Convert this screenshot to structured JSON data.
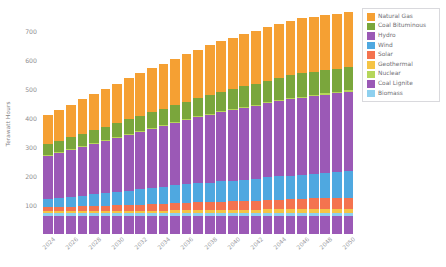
{
  "chart_data": {
    "type": "bar",
    "stacked": true,
    "title": "",
    "xlabel": "",
    "ylabel": "Terawatt Hours",
    "ylim": [
      0,
      760
    ],
    "yticks": [
      100,
      200,
      300,
      400,
      500,
      600,
      700
    ],
    "grid": false,
    "legend_position": "right",
    "x": [
      2024,
      2025,
      2026,
      2027,
      2028,
      2029,
      2030,
      2031,
      2032,
      2033,
      2034,
      2035,
      2036,
      2037,
      2038,
      2039,
      2040,
      2041,
      2042,
      2043,
      2044,
      2045,
      2046,
      2047,
      2048,
      2049,
      2050
    ],
    "xtick_labels": [
      "2024",
      "2026",
      "2028",
      "2030",
      "2032",
      "2034",
      "2036",
      "2038",
      "2040",
      "2042",
      "2044",
      "2046",
      "2048",
      "2050"
    ],
    "series": [
      {
        "name": "Coal Lignite",
        "color": "#9b59b6",
        "values": [
          62,
          62,
          62,
          62,
          62,
          62,
          62,
          62,
          62,
          62,
          62,
          62,
          62,
          62,
          62,
          62,
          62,
          62,
          62,
          62,
          62,
          62,
          62,
          62,
          62,
          62,
          62
        ]
      },
      {
        "name": "Biomass",
        "color": "#8ed0ef",
        "values": [
          10,
          10,
          10,
          10,
          10,
          10,
          10,
          10,
          10,
          11,
          11,
          11,
          11,
          11,
          11,
          11,
          11,
          11,
          11,
          12,
          12,
          12,
          12,
          12,
          12,
          12,
          12
        ]
      },
      {
        "name": "Geothermal",
        "color": "#f5c445",
        "values": [
          6,
          6,
          6,
          7,
          7,
          7,
          7,
          8,
          8,
          8,
          8,
          9,
          9,
          9,
          9,
          10,
          10,
          10,
          10,
          11,
          11,
          11,
          11,
          12,
          12,
          12,
          12
        ]
      },
      {
        "name": "Solar",
        "color": "#f4734f",
        "values": [
          14,
          15,
          16,
          17,
          18,
          19,
          20,
          21,
          22,
          23,
          24,
          25,
          26,
          27,
          28,
          29,
          30,
          31,
          32,
          33,
          34,
          35,
          36,
          37,
          38,
          39,
          40
        ]
      },
      {
        "name": "Wind",
        "color": "#4fa8e0",
        "values": [
          28,
          31,
          34,
          37,
          40,
          43,
          46,
          49,
          52,
          55,
          58,
          61,
          64,
          66,
          68,
          70,
          72,
          74,
          76,
          78,
          80,
          82,
          84,
          86,
          88,
          90,
          92
        ]
      },
      {
        "name": "Hydro",
        "color": "#9b59b6",
        "values": [
          150,
          156,
          162,
          168,
          174,
          180,
          186,
          192,
          198,
          204,
          210,
          216,
          222,
          228,
          234,
          240,
          244,
          248,
          252,
          256,
          260,
          264,
          266,
          268,
          270,
          272,
          274
        ]
      },
      {
        "name": "Nuclear",
        "color": "#b5d65a",
        "values": [
          4,
          4,
          4,
          4,
          4,
          4,
          4,
          4,
          4,
          4,
          4,
          4,
          4,
          4,
          4,
          4,
          4,
          4,
          4,
          4,
          4,
          4,
          4,
          4,
          4,
          4,
          4
        ]
      },
      {
        "name": "Coal Bituminous",
        "color": "#7aa63c",
        "values": [
          36,
          38,
          40,
          42,
          44,
          46,
          48,
          50,
          52,
          54,
          56,
          58,
          60,
          62,
          64,
          66,
          68,
          70,
          72,
          74,
          76,
          78,
          80,
          80,
          80,
          80,
          80
        ]
      },
      {
        "name": "Natural Gas",
        "color": "#f5a033",
        "values": [
          100,
          106,
          112,
          118,
          124,
          130,
          136,
          142,
          148,
          152,
          156,
          160,
          164,
          168,
          172,
          176,
          178,
          180,
          182,
          184,
          186,
          188,
          190,
          190,
          190,
          190,
          190
        ]
      }
    ],
    "totals": [
      410,
      428,
      446,
      465,
      483,
      501,
      519,
      538,
      556,
      573,
      589,
      606,
      622,
      637,
      652,
      668,
      679,
      690,
      701,
      712,
      723,
      734,
      745,
      749,
      752,
      755,
      766
    ]
  },
  "legend": {
    "items": [
      {
        "label": "Natural Gas",
        "color": "#f5a033"
      },
      {
        "label": "Coal Bituminous",
        "color": "#7aa63c"
      },
      {
        "label": "Hydro",
        "color": "#9b59b6"
      },
      {
        "label": "Wind",
        "color": "#4fa8e0"
      },
      {
        "label": "Solar",
        "color": "#f4734f"
      },
      {
        "label": "Geothermal",
        "color": "#f5c445"
      },
      {
        "label": "Nuclear",
        "color": "#b5d65a"
      },
      {
        "label": "Coal Lignite",
        "color": "#9b59b6"
      },
      {
        "label": "Biomass",
        "color": "#8ed0ef"
      }
    ]
  },
  "axis": {
    "y_title": "Terawatt Hours"
  }
}
